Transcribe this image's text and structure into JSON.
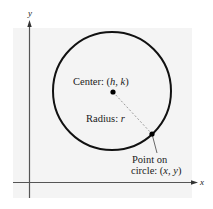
{
  "diagram": {
    "colors": {
      "background": "#ffffff",
      "panel": "#f4f4f4",
      "axis": "#555555",
      "circle": "#111111",
      "radius_line": "#9a9a9a",
      "text": "#1a1a1a"
    },
    "axes": {
      "x_label": "x",
      "y_label": "y"
    },
    "circle": {
      "center_px": [
        112,
        91
      ],
      "radius_px": 59
    },
    "labels": {
      "center_prefix": "Center: (",
      "center_h": "h",
      "center_sep": ", ",
      "center_k": "k",
      "center_suffix": ")",
      "radius_prefix": "Radius: ",
      "radius_var": "r",
      "point_line1": "Point on",
      "point_line2_prefix": "circle: (",
      "point_x": "x",
      "point_sep": ", ",
      "point_y": "y",
      "point_line2_suffix": ")"
    },
    "points": [
      {
        "name": "center",
        "px": [
          113,
          92
        ]
      },
      {
        "name": "point-on-circle",
        "px": [
          152,
          134
        ]
      }
    ]
  }
}
